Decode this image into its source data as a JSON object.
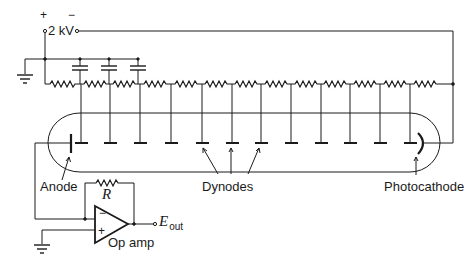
{
  "diagram": {
    "supply": {
      "plus_label": "+",
      "minus_label": "−",
      "voltage_label": "2 kV"
    },
    "labels": {
      "anode": "Anode",
      "dynodes": "Dynodes",
      "photocathode": "Photocathode",
      "resistor": "R",
      "opamp": "Op amp",
      "opamp_minus": "−",
      "opamp_plus": "+",
      "output_main": "E",
      "output_sub": "out"
    },
    "dynode_count": 12,
    "dynode_x": [
      81,
      110,
      140,
      171,
      202,
      232,
      261,
      291,
      321,
      350,
      380,
      410
    ],
    "capacitor_x": [
      80,
      109,
      138
    ],
    "colors": {
      "ink": "#1a1a1a",
      "background": "#ffffff"
    }
  }
}
